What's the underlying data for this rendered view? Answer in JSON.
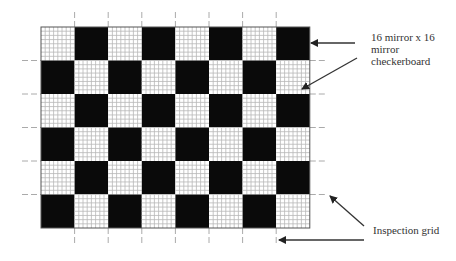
{
  "diagram": {
    "title": "",
    "board": {
      "columns": 8,
      "rows": 6,
      "first_cell": "light",
      "dark_color": "#0a0a0a",
      "light_color": "#ffffff",
      "fine_grid_color": "#b8b8b8",
      "fine_grid_divisions": 8,
      "origin": {
        "x": 41,
        "y": 27
      },
      "cell_w": 33.6,
      "cell_h": 33.5
    },
    "inspection_grid": {
      "tick_color": "#aaaaaa",
      "dash": "6,3"
    },
    "annotations": [
      {
        "id": "board",
        "text": "16 mirror x 16\nmirror\ncheckerboard"
      },
      {
        "id": "grid",
        "text": "Inspection grid"
      }
    ],
    "arrows": [
      {
        "target": "board",
        "x1": 355,
        "y1": 43,
        "x2": 311,
        "y2": 43
      },
      {
        "target": "board",
        "x1": 357,
        "y1": 58,
        "x2": 302,
        "y2": 89
      },
      {
        "target": "grid",
        "x1": 364,
        "y1": 226,
        "x2": 330,
        "y2": 196
      },
      {
        "target": "grid",
        "x1": 364,
        "y1": 240,
        "x2": 279,
        "y2": 240
      }
    ]
  }
}
